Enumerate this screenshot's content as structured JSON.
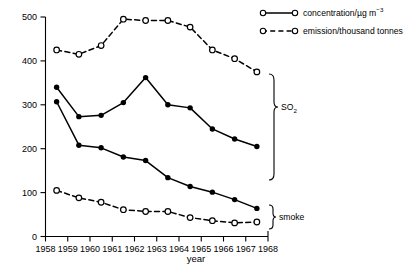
{
  "chart_data": {
    "type": "line",
    "title": "",
    "xlabel": "year",
    "ylabel": "",
    "xlim": [
      1958,
      1968
    ],
    "ylim": [
      0,
      500
    ],
    "yticks": [
      0,
      100,
      200,
      300,
      400,
      500
    ],
    "xticks": [
      1958,
      1959,
      1960,
      1961,
      1962,
      1963,
      1964,
      1965,
      1966,
      1967,
      1968
    ],
    "grid": false,
    "legend_position": "top-right",
    "x": [
      1958.5,
      1959.5,
      1960.5,
      1961.5,
      1962.5,
      1963.5,
      1964.5,
      1965.5,
      1966.5,
      1967.5
    ],
    "series": [
      {
        "name": "SO2 emission/thousand tonnes",
        "group": "SO2",
        "style": "dashed",
        "marker": "open-circle",
        "values": [
          425,
          415,
          435,
          495,
          492,
          492,
          477,
          425,
          405,
          375
        ]
      },
      {
        "name": "SO2 concentration/ug m-3",
        "group": "SO2",
        "style": "solid",
        "marker": "filled-circle",
        "values": [
          340,
          273,
          276,
          305,
          362,
          300,
          293,
          245,
          222,
          205
        ]
      },
      {
        "name": "smoke concentration/ug m-3",
        "group": "smoke",
        "style": "solid",
        "marker": "filled-circle",
        "values": [
          307,
          208,
          202,
          181,
          173,
          134,
          114,
          101,
          84,
          64
        ]
      },
      {
        "name": "smoke emission/thousand tonnes",
        "group": "smoke",
        "style": "dashed",
        "marker": "open-circle",
        "values": [
          105,
          88,
          78,
          61,
          57,
          57,
          43,
          36,
          31,
          33
        ]
      }
    ]
  },
  "legend": {
    "entries": [
      {
        "label_main": "concentration/µg m",
        "label_sup": "−3",
        "style": "solid",
        "marker": "open-circle"
      },
      {
        "label_main": "emission/thousand tonnes",
        "label_sup": "",
        "style": "dashed",
        "marker": "open-circle"
      }
    ]
  },
  "group_labels": {
    "so2_main": "SO",
    "so2_sub": "2",
    "smoke": "smoke"
  },
  "axis": {
    "xlabel": "year",
    "ytick_labels": [
      "0",
      "100",
      "200",
      "300",
      "400",
      "500"
    ],
    "xtick_labels": [
      "1958",
      "1959",
      "1960",
      "1961",
      "1962",
      "1963",
      "1964",
      "1965",
      "1966",
      "1967",
      "1968"
    ]
  },
  "colors": {
    "ink": "#000000",
    "background": "#ffffff"
  }
}
